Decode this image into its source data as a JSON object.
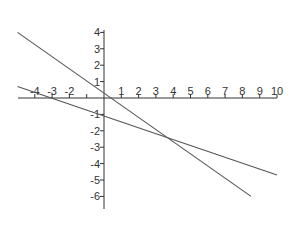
{
  "chart_data": {
    "type": "line",
    "title": "",
    "xlabel": "",
    "ylabel": "",
    "xlim": [
      -5,
      10
    ],
    "ylim": [
      -6,
      4.8
    ],
    "grid": false,
    "x_ticks": [
      -4,
      -3,
      -2,
      -1,
      1,
      2,
      3,
      4,
      5,
      6,
      7,
      8,
      9,
      10
    ],
    "x_tick_labels": [
      "-4",
      "-3",
      "-2",
      "",
      "1",
      "2",
      "3",
      "4",
      "5",
      "6",
      "7",
      "8",
      "9",
      "10"
    ],
    "y_ticks": [
      4,
      3,
      2,
      1,
      -1,
      -2,
      -3,
      -4,
      -5,
      -6
    ],
    "y_tick_labels": [
      "4",
      "3",
      "2",
      "1",
      "-1",
      "-2",
      "-3",
      "-4",
      "-5",
      "-6"
    ],
    "series": [
      {
        "name": "line-steep",
        "equation": "y = -x/1 + 0 (approx. slope -0.67*... passes through (0,0) and (3,-2))",
        "x": [
          -5,
          8.5
        ],
        "y": [
          4,
          -6
        ],
        "color": "#555555"
      },
      {
        "name": "line-shallow",
        "x": [
          -5,
          10
        ],
        "y": [
          0.7,
          -4.7
        ],
        "color": "#555555"
      }
    ],
    "intersection": {
      "x": 3,
      "y": -2
    }
  },
  "origin_px": {
    "x": 104,
    "y": 98
  },
  "scale_px": {
    "x": 17.3,
    "y": 16.4
  }
}
